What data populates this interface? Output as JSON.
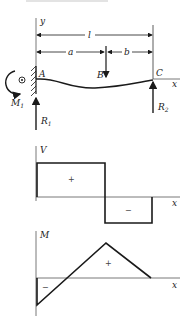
{
  "figure": {
    "beam": {
      "axis_y": "y",
      "axis_x": "x",
      "dimensions": {
        "total": "l",
        "left": "a",
        "right": "b"
      },
      "points": {
        "A": "A",
        "B": "B",
        "C": "C"
      },
      "reactions": {
        "moment": "M",
        "moment_sub": "1",
        "r1": "R",
        "r1_sub": "1",
        "r2": "R",
        "r2_sub": "2"
      }
    },
    "shear_diagram": {
      "ylabel": "V",
      "xlabel": "x",
      "pos_sign": "+",
      "neg_sign": "−"
    },
    "moment_diagram": {
      "ylabel": "M",
      "xlabel": "x",
      "pos_sign": "+",
      "neg_sign": "−"
    },
    "colors": {
      "line": "#1a1a1a",
      "axis": "#555555",
      "caption": "#dddddd"
    }
  }
}
